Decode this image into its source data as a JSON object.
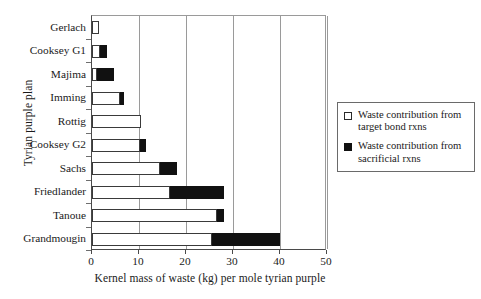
{
  "chart_data": {
    "type": "bar",
    "orientation": "horizontal",
    "stacked": true,
    "title": "",
    "xlabel": "Kernel mass of waste (kg) per mole tyrian purple",
    "ylabel": "Tyrian purple plan",
    "xlim": [
      0,
      50
    ],
    "xticks": [
      0,
      10,
      20,
      30,
      40,
      50
    ],
    "xtick_labels": [
      "0",
      "10",
      "20",
      "30",
      "40",
      "50"
    ],
    "grid": "vertical",
    "legend_position": "right",
    "categories": [
      "Gerlach",
      "Cooksey G1",
      "Majima",
      "Imming",
      "Rottig",
      "Cooksey G2",
      "Sachs",
      "Friedlander",
      "Tanoue",
      "Grandmougin"
    ],
    "series": [
      {
        "name": "Waste contribution from target bond rxns",
        "color": "#ffffff",
        "values": [
          1.5,
          1.6,
          1.0,
          6.0,
          10.5,
          10.3,
          14.5,
          16.5,
          26.5,
          25.5
        ]
      },
      {
        "name": "Waste contribution from sacrificial rxns",
        "color": "#111111",
        "values": [
          0.0,
          1.5,
          3.6,
          0.9,
          0.0,
          1.2,
          3.5,
          11.5,
          1.6,
          14.5
        ]
      }
    ],
    "totals": [
      1.5,
      3.1,
      4.6,
      6.9,
      10.5,
      11.5,
      18.0,
      28.0,
      28.1,
      40.0
    ]
  },
  "legend": {
    "entries": [
      {
        "marker": "open-square",
        "line1": "Waste contribution from",
        "line2": "target bond rxns"
      },
      {
        "marker": "filled-square",
        "line1": "Waste contribution from",
        "line2": "sacrificial rxns"
      }
    ]
  }
}
